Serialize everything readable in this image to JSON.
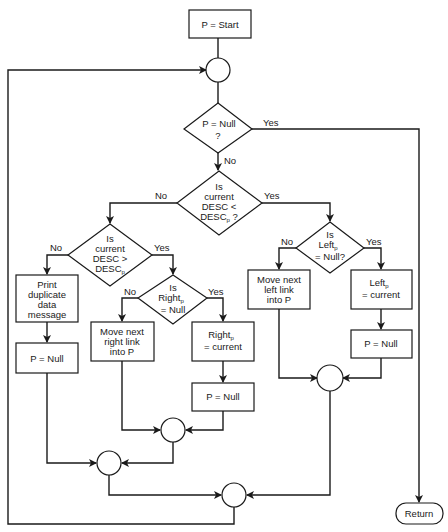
{
  "diagram": {
    "type": "flowchart",
    "nodes": {
      "start": {
        "label": "P = Start"
      },
      "d_null": {
        "line1": "P = Null",
        "line2": "?"
      },
      "d_less": {
        "line1": "Is",
        "line2": "current",
        "line3": "DESC <",
        "line4": "DESC",
        "line4_sub": "p",
        "line4_suffix": " ?"
      },
      "d_greater": {
        "line1": "Is",
        "line2": "current",
        "line3": "DESC >",
        "line4": "DESC",
        "line4_sub": "p"
      },
      "d_right": {
        "line1": "Is",
        "line2": "Right",
        "line2_sub": "p",
        "line3": "= Null"
      },
      "d_left": {
        "line1": "Is",
        "line2": "Left",
        "line2_sub": "p",
        "line3": "= Null?"
      },
      "print_dup": {
        "line1": "Print",
        "line2": "duplicate",
        "line3": "data",
        "line4": "message"
      },
      "p_null_1": {
        "label": "P = Null"
      },
      "move_right": {
        "line1": "Move next",
        "line2": "right link",
        "line3": "into P"
      },
      "right_current": {
        "line1": "Right",
        "line1_sub": "p",
        "line2": "= current"
      },
      "p_null_2": {
        "label": "P = Null"
      },
      "move_left": {
        "line1": "Move next",
        "line2": "left link",
        "line3": "into P"
      },
      "left_current": {
        "line1": "Left",
        "line1_sub": "p",
        "line2": "= current"
      },
      "p_null_3": {
        "label": "P = Null"
      },
      "return": {
        "label": "Return"
      }
    },
    "edge_labels": {
      "null_yes": "Yes",
      "null_no": "No",
      "less_no": "No",
      "less_yes": "Yes",
      "greater_no": "No",
      "greater_yes": "Yes",
      "right_no": "No",
      "right_yes": "Yes",
      "left_no": "No",
      "left_yes": "Yes"
    }
  }
}
